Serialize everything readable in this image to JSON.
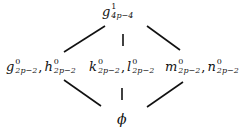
{
  "diagram": {
    "type": "hasse-lattice",
    "top": {
      "base": "g",
      "sup": "1",
      "sub": "4p−4"
    },
    "middle": [
      {
        "terms": [
          {
            "base": "g",
            "sup": "0",
            "sub": "2p−2"
          },
          {
            "base": "h",
            "sup": "0",
            "sub": "2p−2"
          }
        ]
      },
      {
        "terms": [
          {
            "base": "k",
            "sup": "0",
            "sub": "2p−2"
          },
          {
            "base": "l",
            "sup": "0",
            "sub": "2p−2"
          }
        ]
      },
      {
        "terms": [
          {
            "base": "m",
            "sup": "0",
            "sub": "2p−2"
          },
          {
            "base": "n",
            "sup": "0",
            "sub": "2p−2"
          }
        ]
      }
    ],
    "bottom": {
      "label": "ϕ"
    },
    "separator": ",",
    "edges": [
      {
        "from": "top",
        "to": "middle.0"
      },
      {
        "from": "top",
        "to": "middle.1"
      },
      {
        "from": "top",
        "to": "middle.2"
      },
      {
        "from": "middle.0",
        "to": "bottom"
      },
      {
        "from": "middle.1",
        "to": "bottom"
      },
      {
        "from": "middle.2",
        "to": "bottom"
      }
    ]
  }
}
